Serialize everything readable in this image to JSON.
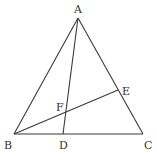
{
  "figure": {
    "type": "geometry-triangle",
    "points": {
      "A": {
        "label": "A"
      },
      "B": {
        "label": "B"
      },
      "C": {
        "label": "C"
      },
      "D": {
        "label": "D",
        "on": "BC"
      },
      "E": {
        "label": "E",
        "on": "AC"
      },
      "F": {
        "label": "F",
        "intersection_of": [
          "AD",
          "BE"
        ]
      }
    },
    "segments": [
      "AB",
      "AC",
      "BC",
      "AD",
      "BE"
    ],
    "colors": {
      "line": "#3a3a3a",
      "text": "#333333",
      "background": "#ffffff"
    }
  }
}
